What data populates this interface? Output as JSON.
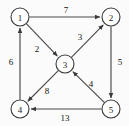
{
  "figure": {
    "name": "directed-weighted-graph",
    "background_color": "#fbfbfb",
    "edge_color": "#4a4a4a",
    "node_fill": "#ffffff",
    "node_stroke": "#3a3a3a",
    "text_color": "#111111",
    "width": 129,
    "height": 126
  },
  "chart_data": {
    "type": "diagram",
    "subtype": "directed-weighted-graph",
    "title": "",
    "xlabel": "",
    "ylabel": "",
    "directed": true,
    "weighted": true,
    "nodes": [
      {
        "id": "1",
        "label": "1",
        "x": 20,
        "y": 17,
        "r": 9
      },
      {
        "id": "2",
        "label": "2",
        "x": 111,
        "y": 17,
        "r": 9
      },
      {
        "id": "3",
        "label": "3",
        "x": 65,
        "y": 64,
        "r": 9
      },
      {
        "id": "4",
        "label": "4",
        "x": 20,
        "y": 109,
        "r": 9
      },
      {
        "id": "5",
        "label": "5",
        "x": 111,
        "y": 109,
        "r": 9
      }
    ],
    "edges": [
      {
        "from": "1",
        "to": "2",
        "weight": "7",
        "label_x": 66,
        "label_y": 10
      },
      {
        "from": "1",
        "to": "3",
        "weight": "2",
        "label_x": 37,
        "label_y": 49
      },
      {
        "from": "3",
        "to": "2",
        "weight": "3",
        "label_x": 80,
        "label_y": 37
      },
      {
        "from": "2",
        "to": "5",
        "weight": "5",
        "label_x": 120,
        "label_y": 62
      },
      {
        "from": "5",
        "to": "3",
        "weight": "4",
        "label_x": 91,
        "label_y": 84
      },
      {
        "from": "5",
        "to": "4",
        "weight": "13",
        "label_x": 65,
        "label_y": 118
      },
      {
        "from": "3",
        "to": "4",
        "weight": "8",
        "label_x": 47,
        "label_y": 91
      },
      {
        "from": "4",
        "to": "1",
        "weight": "6",
        "label_x": 11,
        "label_y": 62
      }
    ]
  }
}
